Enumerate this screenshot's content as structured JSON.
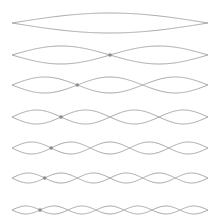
{
  "diagram": {
    "title": "",
    "string_color": "#a8a8a8",
    "node_color": "#8c8c8c",
    "x_start": 12,
    "x_end": 208,
    "modes": [
      {
        "harmonic": 1,
        "center_y": 23,
        "amplitude": 10,
        "marker_node": null
      },
      {
        "harmonic": 2,
        "center_y": 55,
        "amplitude": 9,
        "marker_node": 1
      },
      {
        "harmonic": 3,
        "center_y": 85,
        "amplitude": 8,
        "marker_node": 1
      },
      {
        "harmonic": 4,
        "center_y": 117,
        "amplitude": 7,
        "marker_node": 1
      },
      {
        "harmonic": 5,
        "center_y": 148,
        "amplitude": 6,
        "marker_node": 1
      },
      {
        "harmonic": 6,
        "center_y": 178,
        "amplitude": 5,
        "marker_node": 1
      },
      {
        "harmonic": 7,
        "center_y": 210,
        "amplitude": 4,
        "marker_node": 1
      }
    ]
  }
}
